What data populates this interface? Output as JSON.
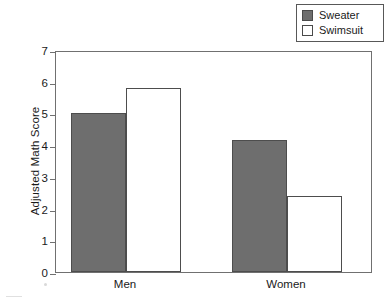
{
  "chart_data": {
    "type": "bar",
    "title": "",
    "subtitle": "",
    "xlabel": "",
    "ylabel": "Adjusted Math Score",
    "categories": [
      "Men",
      "Women"
    ],
    "series": [
      {
        "name": "Sweater",
        "values": [
          5.0,
          4.15
        ],
        "color": "#6e6e6e"
      },
      {
        "name": "Swimsuit",
        "values": [
          5.8,
          2.4
        ],
        "color": "#ffffff"
      }
    ],
    "ylim": [
      0,
      7
    ],
    "yticks": [
      0,
      1,
      2,
      3,
      4,
      5,
      6,
      7
    ],
    "ytick_labels": [
      "0",
      "1",
      "2",
      "3",
      "4",
      "5",
      "6",
      "7"
    ],
    "grid": false,
    "legend_position": "top-right",
    "bar_grouping": "adjacent",
    "annotations": []
  },
  "legend": {
    "entries": [
      {
        "label": "Sweater",
        "swatch": "filled-dark-gray-square"
      },
      {
        "label": "Swimsuit",
        "swatch": "hollow-white-square"
      }
    ]
  },
  "axes": {
    "y_title": "Adjusted Math Score",
    "y_ticks": [
      "0",
      "1",
      "2",
      "3",
      "4",
      "5",
      "6",
      "7"
    ],
    "x_ticks": [
      "Men",
      "Women"
    ]
  }
}
